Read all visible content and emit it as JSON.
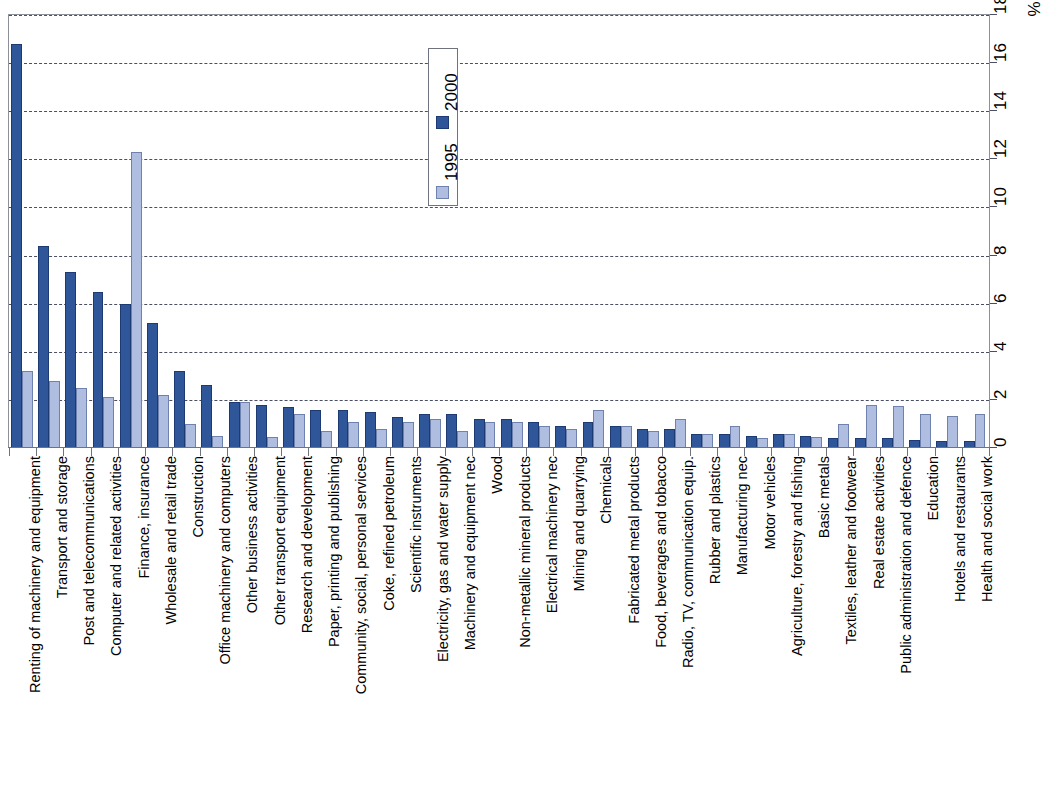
{
  "chart_data": {
    "type": "bar",
    "title": "",
    "subtitle": "",
    "xlabel": "",
    "ylabel": "",
    "yunit": "%",
    "ylim": [
      0,
      18
    ],
    "ytick_step": 2,
    "yticks": [
      "0",
      "2",
      "4",
      "6",
      "8",
      "10",
      "12",
      "14",
      "16",
      "18"
    ],
    "grid": true,
    "grid_axis": "y",
    "legend_position": "top-center",
    "orientation": "vertical",
    "categories": [
      "Renting of machinery and equipment",
      "Transport and storage",
      "Post and telecommunications",
      "Computer and related activities",
      "Finance, insurance",
      "Wholesale and retail trade",
      "Construction",
      "Office machinery and computers",
      "Other business activities",
      "Other transport equipment",
      "Research and development",
      "Paper, printing and publishing",
      "Community, social, personal services",
      "Coke, refined petroleum",
      "Scientific instruments",
      "Electricity, gas and water supply",
      "Machinery and equipment nec",
      "Wood",
      "Non-metallic mineral products",
      "Electrical machinery nec",
      "Mining and quarrying",
      "Chemicals",
      "Fabricated metal products",
      "Food, beverages and tobacco",
      "Radio, TV, communication equip.",
      "Rubber and plastics",
      "Manufacturing nec",
      "Motor vehicles",
      "Agriculture, forestry and fishing",
      "Basic metals",
      "Textiles, leather and footwear",
      "Real estate activities",
      "Public administration and defence",
      "Education",
      "Hotels and restaurants",
      "Health and social work"
    ],
    "series": [
      {
        "name": "2000",
        "color": "#2f5699",
        "values": [
          16.8,
          8.4,
          7.3,
          6.5,
          6.0,
          5.2,
          3.2,
          2.6,
          1.9,
          1.8,
          1.7,
          1.6,
          1.6,
          1.5,
          1.3,
          1.4,
          1.4,
          1.2,
          1.2,
          1.1,
          0.9,
          1.1,
          0.9,
          0.8,
          0.8,
          0.6,
          0.6,
          0.5,
          0.6,
          0.5,
          0.4,
          0.4,
          0.4,
          0.35,
          0.3,
          0.3
        ]
      },
      {
        "name": "1995",
        "color": "#aebde0",
        "values": [
          3.2,
          2.8,
          2.5,
          2.1,
          12.3,
          2.2,
          1.0,
          0.5,
          1.9,
          0.45,
          1.4,
          0.7,
          1.1,
          0.8,
          1.1,
          1.2,
          0.7,
          1.1,
          1.1,
          0.9,
          0.8,
          1.6,
          0.9,
          0.7,
          1.2,
          0.6,
          0.9,
          0.4,
          0.6,
          0.45,
          1.0,
          1.8,
          1.75,
          1.4,
          1.35,
          1.4
        ]
      }
    ],
    "legend": [
      {
        "label": "2000",
        "color": "#2f5699"
      },
      {
        "label": "1995",
        "color": "#aebde0"
      }
    ]
  }
}
